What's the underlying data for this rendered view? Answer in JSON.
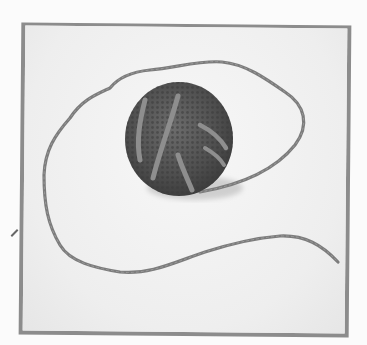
{
  "image": {
    "description": "Black-and-white photo of a small crocheted ball wrapped with a few strands of yarn, with a long loose yarn tail looping around it, inside a gray border frame",
    "subject": "crocheted ball with yarn strand",
    "colors": {
      "background": "#fbfbfb",
      "frame_border": "#8c8c8c",
      "photo_background": "#f0f0f0",
      "ball": "#5a5a5a",
      "yarn": "#7a7a7a"
    }
  }
}
